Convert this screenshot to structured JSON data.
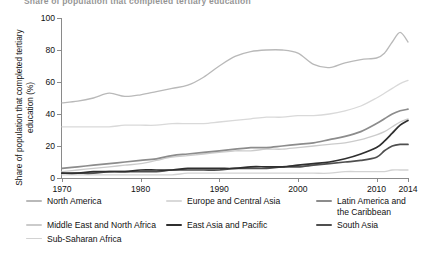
{
  "figure": {
    "title_clipped": "Share of population that completed tertiary education",
    "y_axis_title": "Share of population that completed tertiary education (%)"
  },
  "axes": {
    "y_ticks": [
      "0",
      "20",
      "40",
      "60",
      "80",
      "100"
    ],
    "x_ticks": [
      "1970",
      "1980",
      "1990",
      "2000",
      "2010",
      "2014"
    ]
  },
  "legend": {
    "items": [
      {
        "label": "North America",
        "color": "#b9b9b9"
      },
      {
        "label": "Europe and Central Asia",
        "color": "#d9d9d9"
      },
      {
        "label": "Latin America and the Caribbean",
        "color": "#8c8c8c"
      },
      {
        "label": "Middle East and North Africa",
        "color": "#cbcbcb"
      },
      {
        "label": "East Asia and Pacific",
        "color": "#2f2f2f"
      },
      {
        "label": "South Asia",
        "color": "#4f4f4f"
      },
      {
        "label": "Sub-Saharan Africa",
        "color": "#d2d2d2"
      }
    ]
  },
  "chart_data": {
    "type": "line",
    "title": "Share of population that completed tertiary education",
    "xlabel": "",
    "ylabel": "Share of population that completed tertiary education (%)",
    "xlim": [
      1970,
      2014
    ],
    "ylim": [
      0,
      100
    ],
    "y_ticks": [
      0,
      20,
      40,
      60,
      80,
      100
    ],
    "x_ticks": [
      1970,
      1980,
      1990,
      2000,
      2010,
      2014
    ],
    "grid": false,
    "legend_position": "below",
    "x": [
      1970,
      1972,
      1974,
      1976,
      1978,
      1980,
      1982,
      1984,
      1986,
      1988,
      1990,
      1992,
      1994,
      1996,
      1998,
      2000,
      2002,
      2004,
      2006,
      2008,
      2010,
      2011,
      2012,
      2013,
      2014
    ],
    "series": [
      {
        "name": "North America",
        "color": "#b9b9b9",
        "values": [
          47,
          48,
          50,
          53,
          51,
          52,
          54,
          56,
          58,
          63,
          70,
          76,
          79,
          80,
          80,
          78,
          71,
          69,
          72,
          74,
          75,
          78,
          85,
          91,
          85
        ]
      },
      {
        "name": "Europe and Central Asia",
        "color": "#d9d9d9",
        "values": [
          32,
          32,
          32,
          32,
          33,
          33,
          33,
          34,
          34,
          34,
          35,
          36,
          37,
          38,
          38,
          39,
          39,
          40,
          42,
          45,
          50,
          53,
          56,
          59,
          61
        ]
      },
      {
        "name": "Latin America and the Caribbean",
        "color": "#8c8c8c",
        "values": [
          6,
          7,
          8,
          9,
          10,
          11,
          12,
          14,
          15,
          16,
          17,
          18,
          19,
          19,
          20,
          21,
          22,
          24,
          26,
          29,
          34,
          37,
          40,
          42,
          43
        ]
      },
      {
        "name": "Middle East and North Africa",
        "color": "#cbcbcb",
        "values": [
          4,
          5,
          6,
          7,
          8,
          9,
          11,
          13,
          14,
          15,
          16,
          17,
          17,
          18,
          18,
          19,
          20,
          21,
          22,
          24,
          27,
          29,
          32,
          35,
          37
        ]
      },
      {
        "name": "East Asia and Pacific",
        "color": "#2f2f2f",
        "values": [
          3,
          3,
          4,
          4,
          4,
          5,
          5,
          5,
          6,
          6,
          6,
          6,
          7,
          7,
          7,
          8,
          9,
          10,
          12,
          15,
          19,
          23,
          28,
          33,
          36
        ]
      },
      {
        "name": "South Asia",
        "color": "#4f4f4f",
        "values": [
          3,
          3,
          3,
          4,
          4,
          4,
          4,
          5,
          5,
          5,
          5,
          6,
          6,
          6,
          7,
          7,
          8,
          9,
          10,
          11,
          13,
          17,
          20,
          21,
          21
        ]
      },
      {
        "name": "Sub-Saharan Africa",
        "color": "#d2d2d2",
        "values": [
          2,
          2,
          2,
          2,
          2,
          2,
          2,
          2,
          3,
          3,
          3,
          3,
          3,
          3,
          3,
          3,
          3,
          3,
          4,
          4,
          4,
          4,
          5,
          5,
          5
        ]
      }
    ]
  }
}
